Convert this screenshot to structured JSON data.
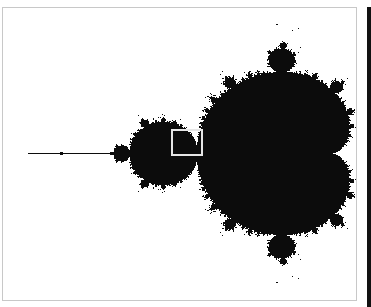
{
  "image": {
    "subject": "Mandelbrot set",
    "colors": {
      "set": "#0c0c0c",
      "background": "#ffffff",
      "frame_border": "#c8c8c8",
      "selection_box": "#e6e6e6",
      "right_strip": "#111111"
    },
    "view": {
      "re_origin_px": 28,
      "re_min_value": -2.0,
      "px_per_unit_x": 135,
      "im_center_px": 153,
      "px_per_unit_y": 125,
      "max_iter": 60
    },
    "selection_box": {
      "x": 171,
      "y": 129,
      "w": 32,
      "h": 27
    }
  }
}
